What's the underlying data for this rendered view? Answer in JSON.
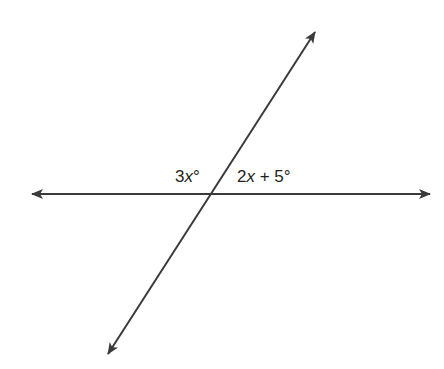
{
  "diagram": {
    "type": "intersecting-lines",
    "line_color": "#3a3a3a",
    "lines": [
      {
        "name": "horizontal-line",
        "from": [
          30,
          194
        ],
        "to": [
          432,
          194
        ],
        "arrows": "both"
      },
      {
        "name": "transversal-line",
        "from": [
          107,
          356
        ],
        "to": [
          316,
          30
        ],
        "arrows": "both"
      }
    ],
    "labels": {
      "left_angle": {
        "coef": "3",
        "var": "x",
        "suffix": "°"
      },
      "right_angle": {
        "coef": "2",
        "var": "x",
        "rest": " + 5",
        "suffix": "°"
      }
    }
  }
}
